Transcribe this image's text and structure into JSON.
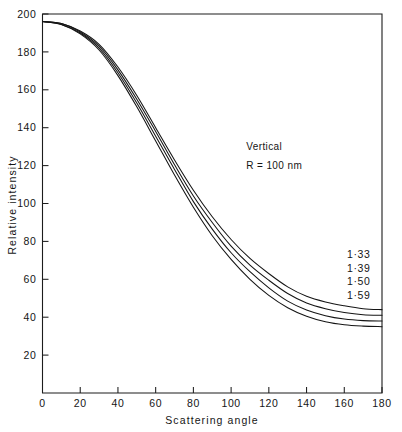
{
  "chart_data": {
    "type": "line",
    "title": "",
    "xlabel": "Scattering angle",
    "ylabel": "Relative intensity",
    "xlim": [
      0,
      180
    ],
    "ylim": [
      0,
      200
    ],
    "grid": false,
    "legend_position": "inline-right",
    "xticks": [
      0,
      20,
      40,
      60,
      80,
      100,
      120,
      140,
      160,
      180
    ],
    "xtick_labels": [
      "0",
      "20",
      "40",
      "60",
      "80",
      "100",
      "120",
      "140",
      "160",
      "180"
    ],
    "yticks": [
      20,
      40,
      60,
      80,
      100,
      120,
      140,
      160,
      180,
      200
    ],
    "ytick_labels": [
      "20",
      "40",
      "60",
      "80",
      "100",
      "120",
      "140",
      "160",
      "180",
      "200"
    ],
    "annotations": [
      {
        "text": "Vertical",
        "x": 108,
        "y": 128
      },
      {
        "text": "R = 100 nm",
        "x": 108,
        "y": 118
      }
    ],
    "x": [
      0,
      10,
      20,
      30,
      40,
      50,
      60,
      70,
      80,
      90,
      100,
      110,
      120,
      130,
      140,
      150,
      160,
      170,
      180
    ],
    "series": [
      {
        "name": "1·33",
        "label": "1·33",
        "color": "#141414",
        "values": [
          196,
          195,
          191,
          184,
          172,
          157,
          140,
          123,
          107,
          93,
          81,
          71,
          63,
          56,
          51,
          48,
          46,
          44.5,
          44
        ]
      },
      {
        "name": "1·39",
        "label": "1·39",
        "color": "#141414",
        "values": [
          196,
          195,
          190.5,
          183,
          170.5,
          155,
          138,
          120.5,
          104,
          90,
          77.5,
          67.5,
          59.5,
          52.5,
          47.5,
          44.5,
          42.5,
          41.3,
          41
        ]
      },
      {
        "name": "1·50",
        "label": "1·50",
        "color": "#141414",
        "values": [
          196,
          194.5,
          190,
          182,
          169,
          153,
          135.5,
          118,
          101,
          86.5,
          74,
          64,
          55.5,
          48.5,
          43.8,
          40.8,
          39,
          38.2,
          38
        ]
      },
      {
        "name": "1·59",
        "label": "1·59",
        "color": "#141414",
        "values": [
          196,
          194.5,
          189.5,
          181,
          167.5,
          151,
          133,
          115,
          98,
          83,
          70.5,
          60,
          51.5,
          45,
          40.5,
          37.6,
          36,
          35.3,
          35
        ]
      }
    ],
    "series_labels": [
      {
        "text": "1·33",
        "value": 1.33
      },
      {
        "text": "1·39",
        "value": 1.39
      },
      {
        "text": "1·50",
        "value": 1.5
      },
      {
        "text": "1·59",
        "value": 1.59
      }
    ]
  }
}
